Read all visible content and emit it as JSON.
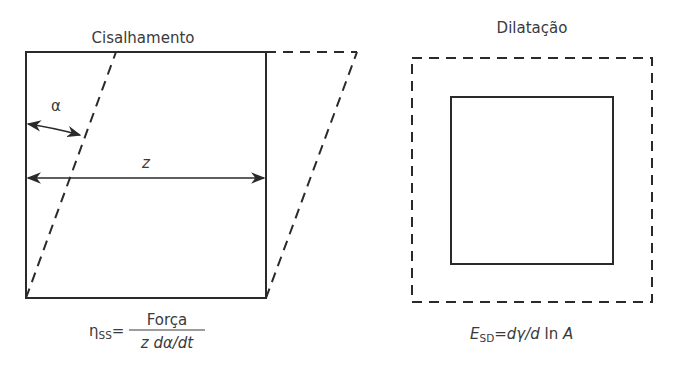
{
  "colors": {
    "stroke": "#2a2a2a",
    "text": "#3a3a3a",
    "background": "#ffffff"
  },
  "shear_panel": {
    "title": "Cisalhamento",
    "angle_label": "α",
    "width_label": "z",
    "formula": {
      "lhs_symbol": "η",
      "lhs_subscript": "SS",
      "equals": "=",
      "numerator": "Força",
      "denominator": "z dα/dt"
    }
  },
  "dilation_panel": {
    "title": "Dilatação",
    "formula": {
      "lhs_symbol": "E",
      "lhs_subscript": "SD",
      "equals": "=",
      "rhs_part1": "dγ/d",
      "rhs_part2": " ln ",
      "rhs_part3": "A"
    }
  }
}
